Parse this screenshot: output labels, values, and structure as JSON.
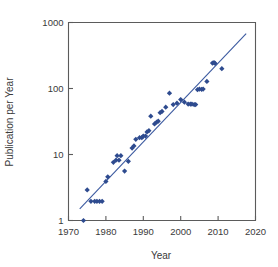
{
  "chart_data": {
    "type": "scatter",
    "title": "",
    "xlabel": "Year",
    "ylabel": "Publication per Year",
    "xlim": [
      1970,
      2020
    ],
    "ylim": [
      1,
      1000
    ],
    "yscale": "log",
    "xscale": "linear",
    "grid": false,
    "legend": null,
    "xticks": [
      1970,
      1980,
      1990,
      2000,
      2010,
      2020
    ],
    "xtick_labels": [
      "1970",
      "1980",
      "1990",
      "2000",
      "2010",
      "2020"
    ],
    "yticks": [
      1,
      10,
      100,
      1000
    ],
    "ytick_labels": [
      "1",
      "10",
      "100",
      "1000"
    ],
    "marker_color": "#2e4b8f",
    "line_color": "#3c5aa0",
    "axis_color": "#5b5b5b",
    "series": [
      {
        "name": "Publications",
        "points": [
          [
            1974,
            1
          ],
          [
            1975,
            2.9
          ],
          [
            1976,
            1.95
          ],
          [
            1977,
            1.95
          ],
          [
            1977.6,
            1.95
          ],
          [
            1978.3,
            1.95
          ],
          [
            1979,
            1.95
          ],
          [
            1980,
            3.9
          ],
          [
            1980.5,
            4.6
          ],
          [
            1982,
            7.6
          ],
          [
            1982.7,
            8.2
          ],
          [
            1983,
            9.6
          ],
          [
            1983.5,
            8.2
          ],
          [
            1984,
            9.6
          ],
          [
            1985,
            5.6
          ],
          [
            1986,
            7.9
          ],
          [
            1987,
            12.5
          ],
          [
            1987.5,
            13.5
          ],
          [
            1988,
            17
          ],
          [
            1989,
            18
          ],
          [
            1989.6,
            18
          ],
          [
            1990,
            19
          ],
          [
            1990.6,
            19
          ],
          [
            1991,
            22
          ],
          [
            1991.5,
            23
          ],
          [
            1992,
            38
          ],
          [
            1993,
            29
          ],
          [
            1993.6,
            31
          ],
          [
            1994,
            32
          ],
          [
            1994.5,
            43
          ],
          [
            1995,
            45
          ],
          [
            1996,
            52
          ],
          [
            1997,
            85
          ],
          [
            1998,
            57
          ],
          [
            1999,
            60
          ],
          [
            2000,
            68
          ],
          [
            2001,
            62
          ],
          [
            2002,
            58
          ],
          [
            2002.6,
            58
          ],
          [
            2003,
            58
          ],
          [
            2003.6,
            57
          ],
          [
            2004,
            57
          ],
          [
            2004.5,
            96
          ],
          [
            2005,
            98
          ],
          [
            2005.6,
            97
          ],
          [
            2006,
            98
          ],
          [
            2007,
            128
          ],
          [
            2008.5,
            243
          ],
          [
            2008.9,
            247
          ],
          [
            2009.2,
            240
          ],
          [
            2011,
            200
          ]
        ]
      }
    ],
    "trendline": {
      "type": "linear-on-log",
      "x_start": 1973.0,
      "y_start": 1.5,
      "x_end": 2017.5,
      "y_end": 680
    }
  }
}
